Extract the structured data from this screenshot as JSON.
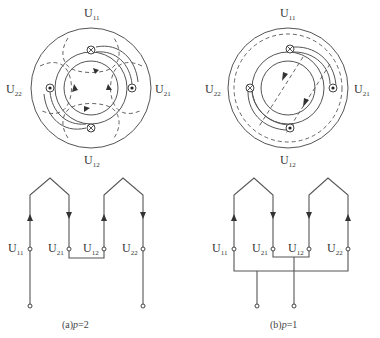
{
  "figure": {
    "panels": [
      {
        "id": "a",
        "caption_prefix": "(a)",
        "caption_var": "p",
        "caption_eq": "=2",
        "pole_pairs": 2,
        "stator_labels": {
          "top": {
            "main": "U",
            "sub": "11"
          },
          "bottom": {
            "main": "U",
            "sub": "12"
          },
          "left": {
            "main": "U",
            "sub": "22"
          },
          "right": {
            "main": "U",
            "sub": "21"
          }
        },
        "conductor_symbols": {
          "top": "cross",
          "bottom": "cross",
          "left": "dot",
          "right": "dot"
        },
        "terminals": [
          {
            "main": "U",
            "sub": "11"
          },
          {
            "main": "U",
            "sub": "21"
          },
          {
            "main": "U",
            "sub": "12"
          },
          {
            "main": "U",
            "sub": "22"
          }
        ],
        "connection": "series"
      },
      {
        "id": "b",
        "caption_prefix": "(b)",
        "caption_var": "p",
        "caption_eq": "=1",
        "pole_pairs": 1,
        "stator_labels": {
          "top": {
            "main": "U",
            "sub": "11"
          },
          "bottom": {
            "main": "U",
            "sub": "12"
          },
          "left": {
            "main": "U",
            "sub": "22"
          },
          "right": {
            "main": "U",
            "sub": "21"
          }
        },
        "conductor_symbols": {
          "top": "cross",
          "bottom": "dot",
          "left": "cross",
          "right": "dot"
        },
        "terminals": [
          {
            "main": "U",
            "sub": "11"
          },
          {
            "main": "U",
            "sub": "21"
          },
          {
            "main": "U",
            "sub": "12"
          },
          {
            "main": "U",
            "sub": "22"
          }
        ],
        "connection": "parallel"
      }
    ],
    "colors": {
      "line": "#555555",
      "text": "#333333",
      "background": "#ffffff"
    }
  }
}
